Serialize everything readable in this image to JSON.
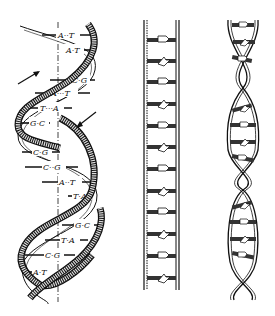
{
  "figure": {
    "panels": [
      {
        "name": "double-helix-with-base-pairs"
      },
      {
        "name": "unwound-ladder"
      },
      {
        "name": "twisted-ladder"
      }
    ],
    "base_pairs": [
      {
        "label": "A··T",
        "y": 35
      },
      {
        "label": "A·T",
        "y": 50
      },
      {
        "label": "C·G",
        "y": 80
      },
      {
        "label": "A···T",
        "y": 93
      },
      {
        "label": "T···A",
        "y": 108
      },
      {
        "label": "G·C",
        "y": 123
      },
      {
        "label": "C·G",
        "y": 152
      },
      {
        "label": "C··G",
        "y": 167
      },
      {
        "label": "A··T",
        "y": 182
      },
      {
        "label": "T·A",
        "y": 196
      },
      {
        "label": "G·C",
        "y": 225
      },
      {
        "label": "T·A",
        "y": 240
      },
      {
        "label": "C·G",
        "y": 255
      },
      {
        "label": "A·T",
        "y": 272
      }
    ],
    "colors": {
      "ink": "#111111",
      "background": "#ffffff"
    }
  }
}
